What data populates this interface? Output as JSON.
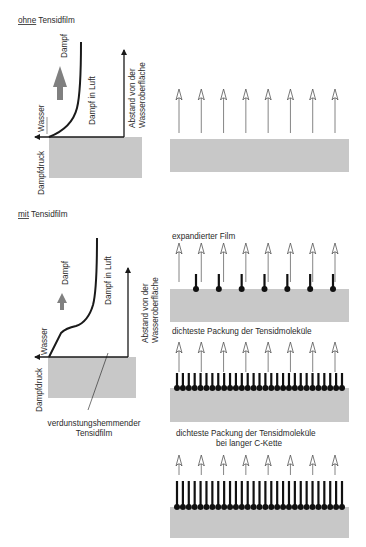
{
  "section_without": {
    "title_underlined": "ohne",
    "title_rest": " Tensidfilm",
    "chart": {
      "labels": {
        "vapor": "Dampf",
        "vapor_in_air": "Dampf in Luft",
        "water": "Wasser",
        "vapor_pressure": "Dampfdruck",
        "distance_line1": "Abstand von der",
        "distance_line2": "Wasseroberfläche"
      },
      "arrow": "large-up-arrow"
    },
    "surface": {
      "arrow_count": 8
    }
  },
  "section_with": {
    "title_underlined": "mit",
    "title_rest": " Tensidfilm",
    "chart": {
      "labels": {
        "vapor": "Dampf",
        "vapor_in_air": "Dampf in Luft",
        "water": "Wasser",
        "vapor_pressure": "Dampfdruck",
        "distance_line1": "Abstand von der",
        "distance_line2": "Wasseroberfläche",
        "film_line1": "verdunstungshemmender",
        "film_line2": "Tensidfilm"
      },
      "arrow": "small-up-arrow"
    },
    "panels": [
      {
        "caption": "expandierter Film",
        "arrow_count": 8,
        "molecule_count": 7
      },
      {
        "caption": "dichteste Packung der Tensidmoleküle",
        "arrow_count": 8,
        "molecule_count": 29
      },
      {
        "caption_line1": "dichteste Packung der Tensidmoleküle",
        "caption_line2": "bei langer C-Kette",
        "arrow_count": 8,
        "molecule_count": 29
      }
    ]
  },
  "colors": {
    "water": "#c8c8c8",
    "line": "#1a1a1a",
    "big_arrow": "#808080",
    "thin_arrow": "#666666"
  }
}
